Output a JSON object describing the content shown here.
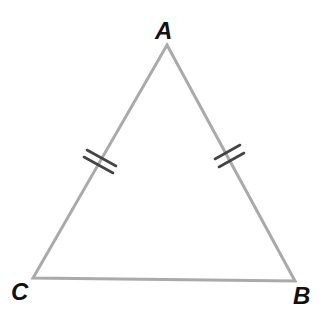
{
  "diagram": {
    "type": "isosceles-triangle",
    "vertices": {
      "A": {
        "label": "A",
        "x": 167,
        "y": 45
      },
      "B": {
        "label": "B",
        "x": 295,
        "y": 281
      },
      "C": {
        "label": "C",
        "x": 33,
        "y": 278
      }
    },
    "sides": [
      {
        "from": "A",
        "to": "C",
        "tick_marks": 2
      },
      {
        "from": "A",
        "to": "B",
        "tick_marks": 2
      },
      {
        "from": "C",
        "to": "B",
        "tick_marks": 0
      }
    ],
    "colors": {
      "edge": "#aaaaaa",
      "tick": "#444444",
      "label": "#111111",
      "background": "#ffffff"
    }
  }
}
